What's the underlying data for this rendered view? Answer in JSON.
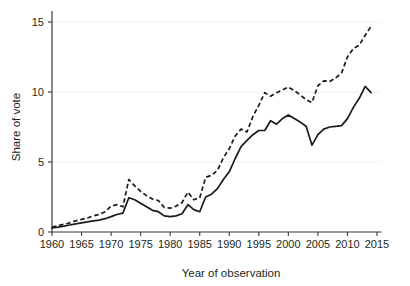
{
  "chart_data": {
    "type": "line",
    "title": "",
    "subtitle": "",
    "xlabel": "Year of observation",
    "ylabel": "Share of vote",
    "xlim": [
      1959,
      2016
    ],
    "ylim": [
      0,
      15.6
    ],
    "xticks": [
      1960,
      1965,
      1970,
      1975,
      1980,
      1985,
      1990,
      1995,
      2000,
      2005,
      2010,
      2015
    ],
    "yticks": [
      0,
      5,
      10,
      15
    ],
    "grid": "horizontal-faint",
    "legend": "none",
    "annotations": [],
    "x": [
      1960,
      1961,
      1962,
      1963,
      1964,
      1965,
      1966,
      1967,
      1968,
      1969,
      1970,
      1971,
      1972,
      1973,
      1974,
      1975,
      1976,
      1977,
      1978,
      1979,
      1980,
      1981,
      1982,
      1983,
      1984,
      1985,
      1986,
      1987,
      1988,
      1989,
      1990,
      1991,
      1992,
      1993,
      1994,
      1995,
      1996,
      1997,
      1998,
      1999,
      2000,
      2001,
      2002,
      2003,
      2004,
      2005,
      2006,
      2007,
      2008,
      2009,
      2010,
      2011,
      2012,
      2013,
      2014
    ],
    "series": [
      {
        "name": "solid-series",
        "style": "solid",
        "color": "#1a1a1a",
        "values": [
          0.3,
          0.35,
          0.42,
          0.5,
          0.58,
          0.65,
          0.72,
          0.8,
          0.85,
          0.95,
          1.1,
          1.25,
          1.35,
          2.45,
          2.3,
          2.05,
          1.8,
          1.55,
          1.45,
          1.15,
          1.1,
          1.15,
          1.3,
          1.95,
          1.6,
          1.45,
          2.5,
          2.7,
          3.1,
          3.75,
          4.3,
          5.25,
          6.1,
          6.55,
          6.95,
          7.25,
          7.25,
          7.95,
          7.7,
          8.1,
          8.35,
          8.1,
          7.85,
          7.55,
          6.2,
          6.95,
          7.35,
          7.5,
          7.55,
          7.6,
          8.1,
          8.9,
          9.55,
          10.4,
          9.95
        ]
      },
      {
        "name": "dashed-series",
        "style": "dashed",
        "color": "#1a1a1a",
        "values": [
          0.35,
          0.45,
          0.55,
          0.65,
          0.8,
          0.9,
          1.0,
          1.15,
          1.25,
          1.45,
          1.85,
          1.95,
          1.8,
          3.75,
          3.3,
          2.9,
          2.6,
          2.35,
          2.25,
          1.75,
          1.7,
          1.85,
          2.1,
          2.85,
          2.3,
          2.45,
          3.9,
          4.05,
          4.4,
          5.3,
          5.95,
          6.85,
          7.35,
          7.15,
          8.25,
          9.05,
          9.95,
          9.7,
          9.95,
          10.15,
          10.35,
          10.1,
          9.8,
          9.45,
          9.25,
          10.45,
          10.8,
          10.75,
          11.0,
          11.35,
          12.5,
          13.1,
          13.35,
          14.05,
          14.7
        ]
      }
    ]
  },
  "axes": {
    "y_tick_labels": [
      "0",
      "5",
      "10",
      "15"
    ],
    "x_tick_labels": [
      "1960",
      "1965",
      "1970",
      "1975",
      "1980",
      "1985",
      "1990",
      "1995",
      "2000",
      "2005",
      "2010",
      "2015"
    ],
    "y_title": "Share of vote",
    "x_title": "Year of observation"
  }
}
